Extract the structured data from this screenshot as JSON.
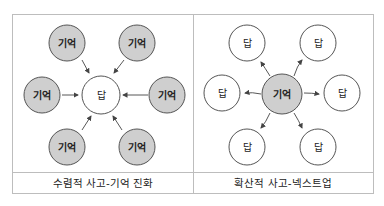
{
  "left_panel": {
    "caption": "수렴적 사고-기억 진화",
    "center": {
      "label": "답",
      "fill": "#ffffff"
    },
    "nodes": [
      {
        "label": "기억",
        "fill": "#cfcfcf"
      },
      {
        "label": "기억",
        "fill": "#cfcfcf"
      },
      {
        "label": "기억",
        "fill": "#cfcfcf"
      },
      {
        "label": "기억",
        "fill": "#cfcfcf"
      },
      {
        "label": "기억",
        "fill": "#cfcfcf"
      },
      {
        "label": "기억",
        "fill": "#cfcfcf"
      }
    ],
    "arrow_direction": "inward"
  },
  "right_panel": {
    "caption": "확산적 사고-넥스트업",
    "center": {
      "label": "기억",
      "fill": "#cfcfcf"
    },
    "nodes": [
      {
        "label": "답",
        "fill": "#ffffff"
      },
      {
        "label": "답",
        "fill": "#ffffff"
      },
      {
        "label": "답",
        "fill": "#ffffff"
      },
      {
        "label": "답",
        "fill": "#ffffff"
      },
      {
        "label": "답",
        "fill": "#ffffff"
      },
      {
        "label": "답",
        "fill": "#ffffff"
      }
    ],
    "arrow_direction": "outward"
  },
  "colors": {
    "border": "#bdbdbd",
    "stroke": "#555555",
    "gray_fill": "#cfcfcf"
  }
}
